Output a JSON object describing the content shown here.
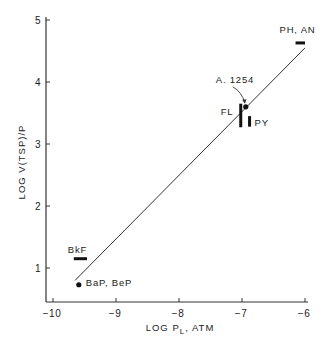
{
  "chart_data": {
    "type": "scatter",
    "title": "",
    "xlabel": "LOG P_L, ATM",
    "xlabel_main": "LOG P",
    "xlabel_sub": "L",
    "xlabel_tail": ", ATM",
    "ylabel": "LOG V(TSP)/P",
    "xlim": [
      -10.05,
      -5.95
    ],
    "ylim": [
      0.45,
      5.05
    ],
    "grid": false,
    "legend": "none",
    "x_ticks": [
      -10,
      -9,
      -8,
      -7,
      -6
    ],
    "x_tick_labels": [
      "-10",
      "-9",
      "-8",
      "-7",
      "-6"
    ],
    "y_ticks": [
      1,
      2,
      3,
      4,
      5
    ],
    "y_tick_labels": [
      "1",
      "2",
      "3",
      "4",
      "5"
    ],
    "fit_line": {
      "x": [
        -9.65,
        -6.0
      ],
      "y": [
        0.8,
        4.55
      ]
    },
    "points": [
      {
        "label": "BaP, BeP",
        "marker": "dot",
        "x": -9.59,
        "y": 0.73
      },
      {
        "label": "A. 1254",
        "marker": "dot",
        "x": -6.94,
        "y": 3.6
      }
    ],
    "ranges": [
      {
        "label": "BkF",
        "orientation": "horizontal",
        "x": [
          -9.67,
          -9.46
        ],
        "y": 1.15
      },
      {
        "label": "PH, AN",
        "orientation": "horizontal",
        "x": [
          -6.15,
          -6.0
        ],
        "y": 4.63
      },
      {
        "label": "FL",
        "orientation": "vertical",
        "x": -7.02,
        "y": [
          3.27,
          3.65
        ]
      },
      {
        "label": "PY",
        "orientation": "vertical",
        "x": -6.88,
        "y": [
          3.28,
          3.45
        ]
      }
    ]
  }
}
